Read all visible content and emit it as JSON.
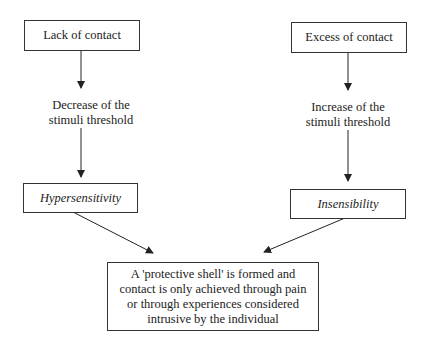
{
  "diagram": {
    "left": {
      "cause": "Lack of contact",
      "effect_line1": "Decrease of the",
      "effect_line2": "stimuli threshold",
      "result": "Hypersensitivity"
    },
    "right": {
      "cause": "Excess of contact",
      "effect_line1": "Increase of the",
      "effect_line2": "stimuli threshold",
      "result": "Insensibility"
    },
    "outcome": {
      "line1": "A 'protective shell' is formed and",
      "line2": "contact is only achieved through pain",
      "line3": "or through experiences considered",
      "line4": "intrusive by the individual"
    }
  }
}
